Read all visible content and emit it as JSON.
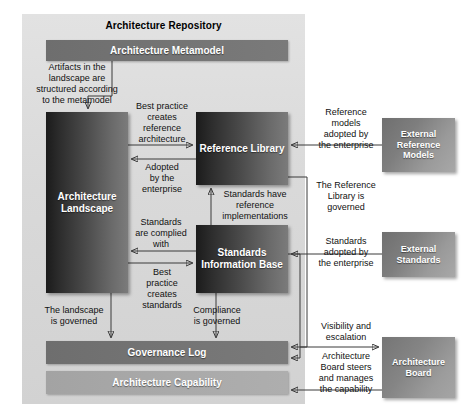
{
  "diagram": {
    "title": "Architecture Repository",
    "type": "block-diagram"
  },
  "repository": {
    "title": "Architecture Repository",
    "boxes": {
      "metamodel": "Architecture Metamodel",
      "landscape": "Architecture\nLandscape",
      "reference_library": "Reference\nLibrary",
      "standards_information_base": "Standards\nInformation Base",
      "governance_log": "Governance Log",
      "architecture_capability": "Architecture Capability"
    }
  },
  "external": {
    "reference_models": "External\nReference\nModels",
    "standards": "External\nStandards",
    "architecture_board": "Architecture\nBoard"
  },
  "labels": {
    "artifacts_structured": "Artifacts in the\nlandscape are\nstructured according\nto the metamodel",
    "best_practice_reference": "Best practice\ncreates\nreference\narchitecture",
    "adopted_by_enterprise": "Adopted\nby the\nenterprise",
    "standards_complied": "Standards\nare complied\nwith",
    "best_practice_standards": "Best\npractice\ncreates\nstandards",
    "standards_have_reference": "Standards have\nreference\nimplementations",
    "reference_models_adopted": "Reference\nmodels\nadopted by\nthe enterprise",
    "reference_library_governed": "The Reference\nLibrary is\ngoverned",
    "standards_adopted": "Standards\nadopted by\nthe enterprise",
    "landscape_governed": "The landscape\nis governed",
    "compliance_governed": "Compliance\nis governed",
    "visibility_escalation": "Visibility and\nescalation",
    "board_steers": "Architecture\nBoard steers\nand manages\nthe capability"
  },
  "colors": {
    "panel_background": "#dcdcdc",
    "box_dark": "#2c2c2c",
    "box_mid": "#8e8e8e",
    "bar_dark": "#747474",
    "bar_light": "#a9a9a9",
    "connector": "#3a3a3a",
    "text_on_box": "#ffffff",
    "text_label": "#111111"
  }
}
